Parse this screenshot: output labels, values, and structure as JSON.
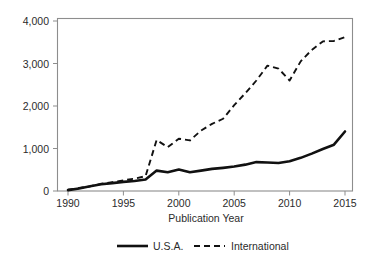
{
  "chart_data": {
    "type": "line",
    "title": "",
    "xlabel": "Publication Year",
    "ylabel": "",
    "xlim": [
      1990,
      2015
    ],
    "ylim": [
      0,
      4000
    ],
    "grid": false,
    "legend_position": "bottom",
    "x": [
      1990,
      1991,
      1992,
      1993,
      1994,
      1995,
      1996,
      1997,
      1998,
      1999,
      2000,
      2001,
      2002,
      2003,
      2004,
      2005,
      2006,
      2007,
      2008,
      2009,
      2010,
      2011,
      2012,
      2013,
      2014,
      2015
    ],
    "xticks": [
      1990,
      1995,
      2000,
      2005,
      2010,
      2015
    ],
    "xtick_labels": [
      "1990",
      "1995",
      "2000",
      "2005",
      "2010",
      "2015"
    ],
    "yticks": [
      0,
      1000,
      2000,
      3000,
      4000
    ],
    "ytick_labels": [
      "0",
      "1,000",
      "2,000",
      "3,000",
      "4,000"
    ],
    "series": [
      {
        "name": "U.S.A.",
        "style": "solid",
        "color": "#111111",
        "values": [
          20,
          60,
          110,
          160,
          185,
          215,
          235,
          270,
          480,
          440,
          505,
          440,
          480,
          520,
          545,
          575,
          620,
          680,
          670,
          660,
          700,
          780,
          880,
          990,
          1090,
          1400
        ]
      },
      {
        "name": "International",
        "style": "dashed",
        "color": "#111111",
        "values": [
          30,
          70,
          110,
          170,
          210,
          250,
          290,
          350,
          1200,
          1030,
          1230,
          1190,
          1420,
          1580,
          1700,
          2020,
          2300,
          2600,
          2950,
          2880,
          2600,
          3050,
          3320,
          3520,
          3530,
          3620
        ]
      }
    ]
  },
  "legend": {
    "items": [
      {
        "label": "U.S.A.",
        "style": "solid"
      },
      {
        "label": "International",
        "style": "dashed"
      }
    ]
  },
  "axes": {
    "x_title": "Publication Year"
  }
}
